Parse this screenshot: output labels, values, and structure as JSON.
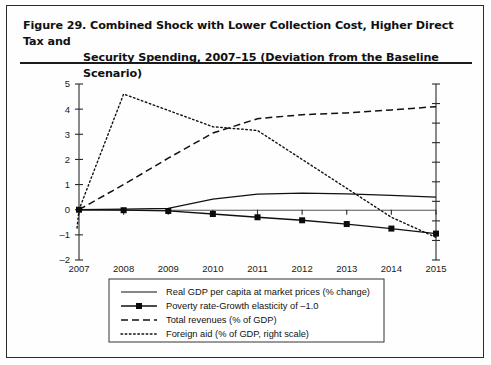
{
  "figure": {
    "label": "Figure 29.",
    "title_line1": "Figure 29.  Combined Shock with Lower Collection Cost, Higher Direct Tax and",
    "title_line2": "Security Spending, 2007–15 (Deviation from the Baseline Scenario)"
  },
  "chart_data": {
    "type": "line",
    "title": "Combined Shock with Lower Collection Cost, Higher Direct Tax and Security Spending, 2007–15 (Deviation from the Baseline Scenario)",
    "xlabel": "",
    "ylabel": "",
    "x": [
      2007,
      2008,
      2009,
      2010,
      2011,
      2012,
      2013,
      2014,
      2015
    ],
    "categories": [
      "2007",
      "2008",
      "2009",
      "2010",
      "2011",
      "2012",
      "2013",
      "2014",
      "2015"
    ],
    "ylim": [
      -2,
      5
    ],
    "yticks": [
      -2,
      -1,
      0,
      1,
      2,
      3,
      4,
      5
    ],
    "ytick_labels": [
      "–2",
      "–1",
      "0",
      "1",
      "2",
      "3",
      "4",
      "5"
    ],
    "grid": false,
    "legend_position": "below-plot",
    "right_axis": {
      "present": true,
      "label": "right scale",
      "tick_labels": []
    },
    "series": [
      {
        "name": "Real GDP per capita at market prices (% change)",
        "style": "solid",
        "axis": "left",
        "values": [
          0.0,
          0.02,
          0.05,
          0.42,
          0.62,
          0.66,
          0.63,
          0.57,
          0.5
        ]
      },
      {
        "name": "Poverty rate-Growth elasticity of –1.0",
        "style": "solid-with-square-markers",
        "axis": "left",
        "markers": true,
        "values": [
          0.0,
          -0.02,
          -0.05,
          -0.17,
          -0.3,
          -0.42,
          -0.57,
          -0.75,
          -0.95
        ]
      },
      {
        "name": "Total revenues (% of GDP)",
        "style": "dashed",
        "axis": "left",
        "values": [
          0.0,
          1.0,
          2.05,
          3.05,
          3.62,
          3.78,
          3.85,
          3.97,
          4.1
        ]
      },
      {
        "name": "Foreign aid (% of GDP, right scale)",
        "style": "dotted",
        "axis": "right",
        "values": [
          0.0,
          4.6,
          3.95,
          3.3,
          3.15,
          2.0,
          0.85,
          -0.3,
          -1.1
        ]
      }
    ]
  },
  "legend": {
    "items": [
      {
        "label": "Real GDP per capita at market prices (% change)",
        "style": "solid"
      },
      {
        "label": "Poverty rate-Growth elasticity of –1.0",
        "style": "solid-marker"
      },
      {
        "label": "Total revenues (% of GDP)",
        "style": "dashed"
      },
      {
        "label": "Foreign aid (% of GDP, right scale)",
        "style": "dotted"
      }
    ]
  }
}
